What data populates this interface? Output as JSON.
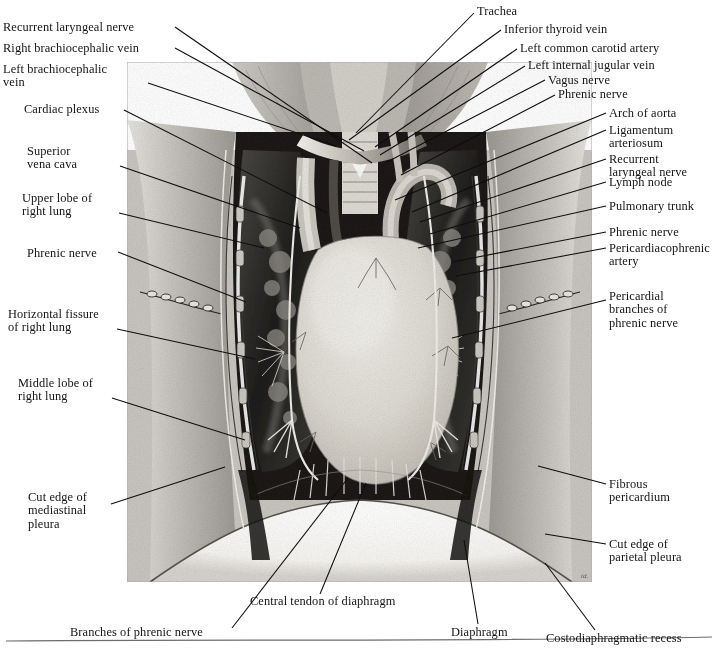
{
  "figure": {
    "signature": "td.",
    "plate": {
      "x": 127,
      "y": 62,
      "w": 465,
      "h": 520
    }
  },
  "labels_left": [
    {
      "id": "recurrent-laryngeal-nerve",
      "text": "Recurrent laryngeal nerve",
      "x": 3,
      "y": 21,
      "tx": 175,
      "ty": 27,
      "px": 372,
      "py": 163
    },
    {
      "id": "right-brachiocephalic-vein",
      "text": "Right brachiocephalic vein",
      "x": 3,
      "y": 42,
      "tx": 175,
      "ty": 48,
      "px": 364,
      "py": 151
    },
    {
      "id": "left-brachiocephalic-vein",
      "text": "Left brachiocephalic\nvein",
      "x": 3,
      "y": 63,
      "tx": 148,
      "ty": 83,
      "px": 336,
      "py": 146
    },
    {
      "id": "cardiac-plexus",
      "text": "Cardiac plexus",
      "x": 24,
      "y": 103,
      "tx": 124,
      "ty": 110,
      "px": 327,
      "py": 213
    },
    {
      "id": "superior-vena-cava",
      "text": "Superior\nvena cava",
      "x": 27,
      "y": 145,
      "tx": 120,
      "ty": 166,
      "px": 300,
      "py": 228
    },
    {
      "id": "upper-lobe-of-right-lung",
      "text": "Upper lobe of\nright lung",
      "x": 22,
      "y": 192,
      "tx": 119,
      "ty": 213,
      "px": 264,
      "py": 248
    },
    {
      "id": "phrenic-nerve-left",
      "text": "Phrenic nerve",
      "x": 27,
      "y": 247,
      "tx": 118,
      "ty": 252,
      "px": 246,
      "py": 302
    },
    {
      "id": "horizontal-fissure-of-right-lung",
      "text": "Horizontal fissure\nof right lung",
      "x": 8,
      "y": 308,
      "tx": 117,
      "ty": 329,
      "px": 255,
      "py": 359
    },
    {
      "id": "middle-lobe-of-right-lung",
      "text": "Middle lobe of\nright lung",
      "x": 18,
      "y": 377,
      "tx": 112,
      "ty": 398,
      "px": 245,
      "py": 440
    },
    {
      "id": "cut-edge-of-mediastinal-pleura",
      "text": "Cut edge of\nmediastinal\npleura",
      "x": 28,
      "y": 491,
      "tx": 111,
      "ty": 504,
      "px": 225,
      "py": 467
    }
  ],
  "labels_right": [
    {
      "id": "trachea",
      "text": "Trachea",
      "x": 477,
      "y": 5,
      "tx": 474,
      "ty": 13,
      "px": 356,
      "py": 133
    },
    {
      "id": "inferior-thyroid-vein",
      "text": "Inferior thyroid vein",
      "x": 504,
      "y": 23,
      "tx": 501,
      "ty": 30,
      "px": 349,
      "py": 140
    },
    {
      "id": "left-common-carotid-artery",
      "text": "Left common carotid artery",
      "x": 520,
      "y": 42,
      "tx": 517,
      "ty": 49,
      "px": 375,
      "py": 147
    },
    {
      "id": "left-internal-jugular-vein",
      "text": "Left internal jugular vein",
      "x": 528,
      "y": 59,
      "tx": 525,
      "ty": 66,
      "px": 380,
      "py": 155
    },
    {
      "id": "vagus-nerve",
      "text": "Vagus nerve",
      "x": 548,
      "y": 74,
      "tx": 545,
      "ty": 80,
      "px": 387,
      "py": 162
    },
    {
      "id": "phrenic-nerve-right-top",
      "text": "Phrenic nerve",
      "x": 558,
      "y": 88,
      "tx": 555,
      "ty": 95,
      "px": 401,
      "py": 175
    },
    {
      "id": "arch-of-aorta",
      "text": "Arch of aorta",
      "x": 609,
      "y": 107,
      "tx": 606,
      "ty": 113,
      "px": 395,
      "py": 200
    },
    {
      "id": "ligamentum-arteriosum",
      "text": "Ligamentum\narteriosum",
      "x": 609,
      "y": 124,
      "tx": 606,
      "ty": 130,
      "px": 412,
      "py": 212
    },
    {
      "id": "recurrent-laryngeal-nerve-right",
      "text": "Recurrent\nlaryngeal nerve",
      "x": 609,
      "y": 153,
      "tx": 606,
      "ty": 159,
      "px": 420,
      "py": 222
    },
    {
      "id": "lymph-node",
      "text": "Lymph node",
      "x": 609,
      "y": 176,
      "tx": 606,
      "ty": 182,
      "px": 430,
      "py": 234
    },
    {
      "id": "pulmonary-trunk",
      "text": "Pulmonary trunk",
      "x": 609,
      "y": 200,
      "tx": 606,
      "ty": 206,
      "px": 418,
      "py": 248
    },
    {
      "id": "phrenic-nerve-right",
      "text": "Phrenic nerve",
      "x": 609,
      "y": 226,
      "tx": 606,
      "ty": 232,
      "px": 452,
      "py": 262
    },
    {
      "id": "pericardiacophrenic-artery",
      "text": "Pericardiacophrenic\nartery",
      "x": 609,
      "y": 242,
      "tx": 606,
      "ty": 248,
      "px": 456,
      "py": 276
    },
    {
      "id": "pericardial-branches-of-phrenic-nerve",
      "text": "Pericardial\nbranches of\nphrenic nerve",
      "x": 609,
      "y": 290,
      "tx": 606,
      "ty": 300,
      "px": 452,
      "py": 338
    },
    {
      "id": "fibrous-pericardium",
      "text": "Fibrous\npericardium",
      "x": 609,
      "y": 478,
      "tx": 606,
      "ty": 484,
      "px": 538,
      "py": 466
    },
    {
      "id": "cut-edge-of-parietal-pleura",
      "text": "Cut edge of\nparietal pleura",
      "x": 609,
      "y": 538,
      "tx": 606,
      "ty": 544,
      "px": 545,
      "py": 534
    }
  ],
  "labels_bottom": [
    {
      "id": "branches-of-phrenic-nerve",
      "text": "Branches of phrenic nerve",
      "x": 70,
      "y": 626,
      "tx": 232,
      "ty": 628,
      "px": 348,
      "py": 478
    },
    {
      "id": "central-tendon-of-diaphragm",
      "text": "Central tendon of diaphragm",
      "x": 250,
      "y": 595,
      "tx": 320,
      "ty": 594,
      "px": 366,
      "py": 483
    },
    {
      "id": "diaphragm",
      "text": "Diaphragm",
      "x": 451,
      "y": 626,
      "tx": 478,
      "ty": 624,
      "px": 464,
      "py": 540
    },
    {
      "id": "costodiaphragmatic-recess",
      "text": "Costodiaphragmatic recess",
      "x": 546,
      "y": 632,
      "tx": 595,
      "ty": 630,
      "px": 545,
      "py": 563
    }
  ],
  "colors": {
    "ink": "#141414",
    "leader": "#0d0d0d",
    "rule": "#6d6d6d",
    "page": "#ffffff",
    "pericardium": "#d8d6cf",
    "lung_dark": "#2a2a28",
    "chest_wall": "#a9a6a0"
  }
}
